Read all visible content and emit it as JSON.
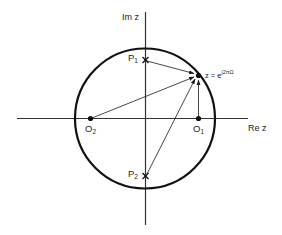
{
  "diagram": {
    "type": "pole-zero plot (z-plane)",
    "axes": {
      "x_label": "Re z",
      "y_label": "Im z"
    },
    "unit_circle": {
      "center": [
        145,
        118.5
      ],
      "radius": 70
    },
    "poles": [
      {
        "name": "P",
        "sub": "1",
        "pos": [
          145.5,
          60
        ]
      },
      {
        "name": "P",
        "sub": "2",
        "pos": [
          145.5,
          176
        ]
      }
    ],
    "zeros": [
      {
        "name": "O",
        "sub": "2",
        "pos": [
          90.5,
          118.5
        ]
      },
      {
        "name": "O",
        "sub": "1",
        "pos": [
          198.5,
          118.5
        ]
      }
    ],
    "evaluation_point": {
      "label_prefix": "z = e",
      "label_exponent": "j2πΩ",
      "pos": [
        198.5,
        75
      ]
    },
    "vectors": [
      {
        "from": "P1",
        "to": "z"
      },
      {
        "from": "P2",
        "to": "z"
      },
      {
        "from": "O2",
        "to": "z"
      },
      {
        "from": "O1",
        "to": "z"
      }
    ]
  },
  "colors": {
    "line": "#1a1a1a",
    "background": "#ffffff"
  }
}
